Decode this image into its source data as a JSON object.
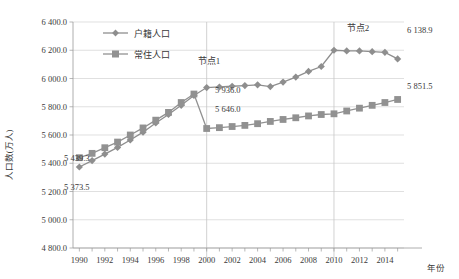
{
  "chart_data": {
    "type": "line",
    "title": "",
    "xlabel": "年份",
    "ylabel": "人口数(万人)",
    "xlim": [
      1989.5,
      2015.5
    ],
    "ylim": [
      4800,
      6400
    ],
    "ytick_step": 200,
    "grid": true,
    "legend_position": "top-left",
    "ytick_labels": [
      "6 400.0",
      "6 200.0",
      "6 000.0",
      "5 800.0",
      "5 600.0",
      "5 400.0",
      "5 200.0",
      "5 000.0",
      "4 800.0"
    ],
    "ytick_values": [
      6400,
      6200,
      6000,
      5800,
      5600,
      5400,
      5200,
      5000,
      4800
    ],
    "xtick_labels": [
      "1990",
      "1992",
      "1994",
      "1996",
      "1998",
      "2000",
      "2002",
      "2004",
      "2006",
      "2008",
      "2010",
      "2012",
      "2014"
    ],
    "xtick_values": [
      1990,
      1992,
      1994,
      1996,
      1998,
      2000,
      2002,
      2004,
      2006,
      2008,
      2010,
      2012,
      2014
    ],
    "x": [
      1990,
      1991,
      1992,
      1993,
      1994,
      1995,
      1996,
      1997,
      1998,
      1999,
      2000,
      2001,
      2002,
      2003,
      2004,
      2005,
      2006,
      2007,
      2008,
      2009,
      2010,
      2011,
      2012,
      2013,
      2014,
      2015
    ],
    "series": [
      {
        "name": "户籍人口",
        "marker": "diamond",
        "color": "#8e8e8e",
        "values": [
          5373.5,
          5419.0,
          5465.0,
          5512.0,
          5565.0,
          5620.0,
          5685.0,
          5745.0,
          5810.0,
          5880.0,
          5936.0,
          5940.0,
          5945.0,
          5950.0,
          5955.0,
          5943.0,
          5975.0,
          6010.0,
          6050.0,
          6085.0,
          6200.0,
          6195.0,
          6195.0,
          6190.0,
          6185.0,
          6138.9
        ]
      },
      {
        "name": "常住人口",
        "marker": "square",
        "color": "#919191",
        "values": [
          5439.3,
          5470.0,
          5510.0,
          5550.0,
          5600.0,
          5650.0,
          5705.0,
          5760.0,
          5830.0,
          5890.0,
          5646.0,
          5652.0,
          5660.0,
          5668.0,
          5680.0,
          5696.0,
          5710.0,
          5722.0,
          5735.0,
          5745.0,
          5750.0,
          5770.0,
          5790.0,
          5810.0,
          5830.0,
          5851.5
        ]
      }
    ],
    "annotations": [
      {
        "name": "node1",
        "text": "节点1",
        "x": 2000,
        "kind": "vline-label"
      },
      {
        "name": "node2",
        "text": "节点2",
        "x": 2010,
        "kind": "vline-label"
      },
      {
        "name": "start-huji",
        "text": "5 373.5",
        "x": 1990,
        "y": 5373.5
      },
      {
        "name": "start-changzhu",
        "text": "5 439.3",
        "x": 1990,
        "y": 5439.3
      },
      {
        "name": "node1-huji",
        "text": "5 936.0",
        "x": 2000,
        "y": 5936.0
      },
      {
        "name": "node1-changzhu",
        "text": "5 646.0",
        "x": 2000,
        "y": 5646.0
      },
      {
        "name": "end-huji",
        "text": "6 138.9",
        "x": 2015,
        "y": 6138.9
      },
      {
        "name": "end-changzhu",
        "text": "5 851.5",
        "x": 2015,
        "y": 5851.5
      }
    ]
  },
  "legend": {
    "items": [
      {
        "label": "户籍人口",
        "marker": "diamond"
      },
      {
        "label": "常住人口",
        "marker": "square"
      }
    ]
  },
  "labels": {
    "y_axis_title": "人口数(万人)",
    "x_axis_title": "年份",
    "node1": "节点1",
    "node2": "节点2",
    "v_start_huji": "5 373.5",
    "v_start_changzhu": "5 439.3",
    "v_node1_huji": "5 936.0",
    "v_node1_changzhu": "5 646.0",
    "v_end_huji": "6 138.9",
    "v_end_changzhu": "5 851.5"
  },
  "colors": {
    "series_huji": "#8e8e8e",
    "series_changzhu": "#919191",
    "grid": "#d2d2d2",
    "axis": "#9a9a9a",
    "text": "#3a3a3a"
  }
}
